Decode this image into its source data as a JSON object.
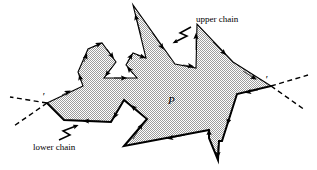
{
  "figure": {
    "background_color": "#ffffff",
    "polygon": {
      "name": "P",
      "label": "P",
      "label_position": {
        "x": 171,
        "y": 101
      },
      "fill_color": "#c9c9c9",
      "fill_pattern": "checkerboard-dither",
      "stroke_color": "#000000",
      "upper_chain_stroke_width": 1.1,
      "lower_chain_stroke_width": 2.0,
      "leftmost_vertex": {
        "x": 47,
        "y": 103
      },
      "rightmost_vertex": {
        "x": 271,
        "y": 86
      },
      "vertices": [
        {
          "x": 47,
          "y": 103
        },
        {
          "x": 83,
          "y": 86
        },
        {
          "x": 78,
          "y": 72
        },
        {
          "x": 88,
          "y": 49
        },
        {
          "x": 102,
          "y": 43
        },
        {
          "x": 116,
          "y": 62
        },
        {
          "x": 104,
          "y": 78
        },
        {
          "x": 137,
          "y": 78
        },
        {
          "x": 126,
          "y": 65
        },
        {
          "x": 133,
          "y": 53
        },
        {
          "x": 146,
          "y": 58
        },
        {
          "x": 133,
          "y": 5
        },
        {
          "x": 175,
          "y": 64
        },
        {
          "x": 196,
          "y": 68
        },
        {
          "x": 197,
          "y": 24
        },
        {
          "x": 233,
          "y": 62
        },
        {
          "x": 271,
          "y": 86
        },
        {
          "x": 237,
          "y": 94
        },
        {
          "x": 222,
          "y": 141
        },
        {
          "x": 219,
          "y": 141
        },
        {
          "x": 218,
          "y": 160
        },
        {
          "x": 209,
          "y": 138
        },
        {
          "x": 209,
          "y": 130
        },
        {
          "x": 124,
          "y": 146
        },
        {
          "x": 147,
          "y": 119
        },
        {
          "x": 124,
          "y": 100
        },
        {
          "x": 111,
          "y": 122
        },
        {
          "x": 64,
          "y": 120
        }
      ],
      "edge_arrow_direction": "counterclockwise-traversal"
    },
    "chains": [
      {
        "id": "upper-chain",
        "label": "upper chain",
        "label_position": {
          "x": 196,
          "y": 22
        },
        "leader": "zigzag-arrow",
        "leader_from": {
          "x": 193,
          "y": 26
        },
        "leader_to": {
          "x": 171,
          "y": 43
        }
      },
      {
        "id": "lower-chain",
        "label": "lower chain",
        "label_position": {
          "x": 33,
          "y": 150
        },
        "leader": "zigzag-arrow",
        "leader_from": {
          "x": 60,
          "y": 141
        },
        "leader_to": {
          "x": 83,
          "y": 124
        }
      }
    ],
    "support_lines": [
      {
        "id": "left-upper-dashed",
        "style": "dashed",
        "from": {
          "x": 47,
          "y": 103
        },
        "to": {
          "x": 10,
          "y": 97
        }
      },
      {
        "id": "left-lower-dashed",
        "style": "dashed",
        "from": {
          "x": 47,
          "y": 103
        },
        "to": {
          "x": 14,
          "y": 126
        }
      },
      {
        "id": "right-upper-dashed",
        "style": "dashed",
        "from": {
          "x": 271,
          "y": 86
        },
        "to": {
          "x": 308,
          "y": 75
        }
      },
      {
        "id": "right-lower-dashed",
        "style": "dashed",
        "from": {
          "x": 271,
          "y": 86
        },
        "to": {
          "x": 305,
          "y": 110
        }
      }
    ],
    "vertex_marks": [
      {
        "id": "left-vertex-prime",
        "glyph": "′",
        "x": 44,
        "y": 99
      },
      {
        "id": "right-vertex-prime",
        "glyph": "′",
        "x": 267,
        "y": 82
      }
    ]
  }
}
